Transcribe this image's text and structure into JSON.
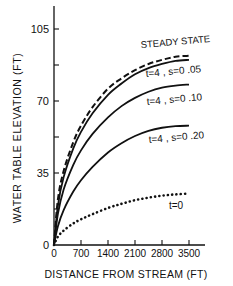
{
  "chart_data": {
    "type": "line",
    "title": "",
    "xlabel": "DISTANCE FROM STREAM (FT)",
    "ylabel": "WATER TABLE ELEVATION (FT)",
    "xlim": [
      0,
      3500
    ],
    "ylim": [
      0,
      115
    ],
    "x_ticks": [
      0,
      700,
      1400,
      2100,
      2800,
      3500
    ],
    "y_ticks": [
      0,
      35,
      70,
      105
    ],
    "y_minor_ticks": [
      17.5,
      52.5,
      87.5
    ],
    "grid": false,
    "legend": "inline labels",
    "x": [
      0,
      100,
      250,
      500,
      700,
      1000,
      1400,
      1750,
      2100,
      2450,
      2800,
      3150,
      3500
    ],
    "series": [
      {
        "name": "STEADY STATE",
        "style": "dashed",
        "values": [
          0,
          22,
          36,
          50,
          58,
          67,
          76,
          81,
          85,
          88,
          90,
          91.5,
          92
        ]
      },
      {
        "name": "t=4, s=0.05",
        "style": "solid",
        "values": [
          0,
          19,
          33,
          47,
          55,
          64,
          73,
          78.5,
          83,
          86,
          88,
          89.5,
          90
        ]
      },
      {
        "name": "t=4, s=0.10",
        "style": "solid",
        "values": [
          0,
          15,
          27,
          39,
          46,
          54,
          62,
          67.5,
          71.5,
          74.5,
          76.5,
          77.5,
          78
        ]
      },
      {
        "name": "t=4, s=0.20",
        "style": "solid",
        "values": [
          0,
          9,
          17,
          26,
          31.5,
          38,
          45,
          49.5,
          53,
          55.5,
          57,
          57.8,
          58
        ]
      },
      {
        "name": "t=0",
        "style": "dotted",
        "values": [
          0,
          4,
          7,
          10.5,
          12.5,
          15,
          18,
          20,
          21.8,
          23,
          24,
          24.6,
          25
        ]
      }
    ]
  },
  "labels": {
    "y_tick_labels": [
      "0",
      "35",
      "70",
      "105"
    ],
    "x_tick_labels": [
      "0",
      "700",
      "1400",
      "2100",
      "2800",
      "3500"
    ],
    "xlabel": "DISTANCE FROM STREAM (FT)",
    "ylabel": "WATER TABLE ELEVATION (FT)",
    "steady": "STEADY STATE",
    "s05": "t=4 , s=0 .05",
    "s10": "t=4 , s=0 .10",
    "s20": "t=4 , s=0 .20",
    "t0": "t=0"
  }
}
